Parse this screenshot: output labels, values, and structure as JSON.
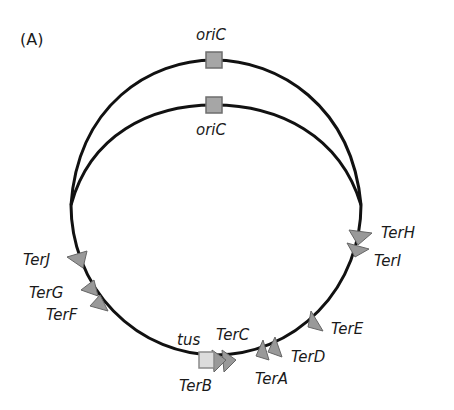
{
  "figure": {
    "panel_label": "(A)",
    "colors": {
      "line": "#111111",
      "marker_fill": "#999999",
      "marker_stroke": "#666666",
      "tus_fill": "#dcdcdc",
      "tus_stroke": "#8a8a8a",
      "text": "#1a1a1a"
    },
    "origins": [
      {
        "label": "oriC",
        "position": "outer-arc-top"
      },
      {
        "label": "oriC",
        "position": "inner-arc-top"
      }
    ],
    "gene": {
      "label": "tus"
    },
    "ter_sites": [
      {
        "label": "TerH",
        "side": "right"
      },
      {
        "label": "TerI",
        "side": "right"
      },
      {
        "label": "TerE",
        "side": "right"
      },
      {
        "label": "TerD",
        "side": "bottom-right"
      },
      {
        "label": "TerA",
        "side": "bottom"
      },
      {
        "label": "TerC",
        "side": "bottom"
      },
      {
        "label": "TerB",
        "side": "bottom"
      },
      {
        "label": "TerF",
        "side": "left"
      },
      {
        "label": "TerG",
        "side": "left"
      },
      {
        "label": "TerJ",
        "side": "left"
      }
    ]
  }
}
